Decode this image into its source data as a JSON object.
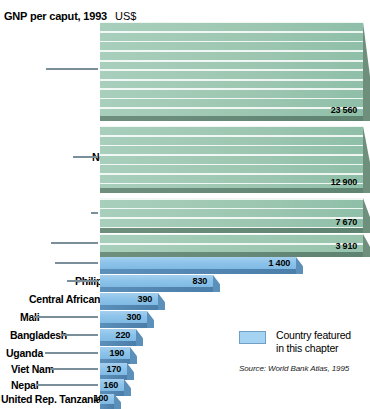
{
  "header": {
    "title": "GNP per caput, 1993",
    "unit": "US$"
  },
  "legend": {
    "label_line1": "Country featured",
    "label_line2": "in this chapter",
    "swatch_color": "#a5d4f2",
    "swatch_name": "legend-swatch-featured"
  },
  "source": "Source: World Bank Atlas, 1995",
  "colors": {
    "green": "#9ec7b2",
    "green_dark": "#6f8f7d",
    "blue": "#8ec4ea",
    "blue_dark": "#5b90bb",
    "leader": "#7a8f9a"
  },
  "chart_data": {
    "type": "bar",
    "orientation": "horizontal",
    "title": "GNP per caput, 1993",
    "xlabel": "US$",
    "ylabel": "",
    "grid": false,
    "legend_position": "bottom-right",
    "legend_entries": [
      "Country featured in this chapter"
    ],
    "annotation": "Source: World Bank Atlas, 1995",
    "note": "Bar lengths are not linearly proportional; top bars are truncated to the plot width.",
    "categories": [
      "Germany",
      "New Zealand",
      "Republic of Korea",
      "Uruguay",
      "Colombia",
      "Philippines",
      "Central African Rep.",
      "Mali",
      "Bangladesh",
      "Uganda",
      "Viet Nam",
      "Nepal",
      "United Rep. Tanzania"
    ],
    "values": [
      23560,
      12900,
      7670,
      3910,
      1400,
      830,
      390,
      300,
      220,
      190,
      170,
      160,
      100
    ],
    "value_labels": [
      "23 560",
      "12 900",
      "7 670",
      "3 910",
      "1 400",
      "830",
      "390",
      "300",
      "220",
      "190",
      "170",
      "160",
      "100"
    ],
    "featured": [
      false,
      false,
      false,
      false,
      true,
      true,
      true,
      true,
      true,
      true,
      true,
      true,
      true
    ],
    "series": [
      {
        "name": "GNP per caput 1993 (US$)",
        "values": [
          23560,
          12900,
          7670,
          3910,
          1400,
          830,
          390,
          300,
          220,
          190,
          170,
          160,
          100
        ]
      }
    ]
  },
  "rows": [
    {
      "label": "Germany",
      "value_label": "23 560",
      "top": 22,
      "height": 94,
      "bar_width": 263,
      "label_x": 193,
      "lead_left": 46,
      "lead_width": 52,
      "color": "green"
    },
    {
      "label": "New Zealand",
      "value_label": "12 900",
      "top": 126,
      "height": 62,
      "bar_width": 263,
      "label_x": 92,
      "lead_left": 73,
      "lead_width": 25,
      "color": "green"
    },
    {
      "label": "Republic of Korea",
      "value_label": "7 670",
      "top": 198,
      "height": 30,
      "bar_width": 263,
      "label_x": 199,
      "lead_left": 91,
      "lead_width": 7,
      "color": "green"
    },
    {
      "label": "Uruguay",
      "value_label": "3 910",
      "top": 234,
      "height": 18,
      "bar_width": 263,
      "label_x": 241,
      "lead_left": 51,
      "lead_width": 47,
      "color": "green"
    },
    {
      "label": "Colombia",
      "value_label": "1 400",
      "top": 257,
      "height": 12,
      "bar_width": 196,
      "label_x": 155,
      "lead_left": 55,
      "lead_width": 43,
      "color": "blue"
    },
    {
      "label": "Philippines",
      "value_label": "830",
      "top": 275,
      "height": 12,
      "bar_width": 113,
      "label_x": 75,
      "lead_left": 67,
      "lead_width": 31,
      "color": "blue"
    },
    {
      "label": "Central African Rep.",
      "value_label": "390",
      "top": 293,
      "height": 12,
      "bar_width": 58,
      "label_x": 29,
      "lead_left": 99,
      "lead_width": 0,
      "color": "blue"
    },
    {
      "label": "Mali",
      "value_label": "300",
      "top": 311,
      "height": 12,
      "bar_width": 47,
      "label_x": 20,
      "lead_left": 33,
      "lead_width": 65,
      "color": "blue"
    },
    {
      "label": "Bangladesh",
      "value_label": "220",
      "top": 329,
      "height": 12,
      "bar_width": 36,
      "label_x": 10,
      "lead_left": 62,
      "lead_width": 36,
      "color": "blue"
    },
    {
      "label": "Uganda",
      "value_label": "190",
      "top": 347,
      "height": 12,
      "bar_width": 30,
      "label_x": 6,
      "lead_left": 45,
      "lead_width": 53,
      "color": "blue"
    },
    {
      "label": "Viet Nam",
      "value_label": "170",
      "top": 363,
      "height": 12,
      "bar_width": 27,
      "label_x": 11,
      "lead_left": 50,
      "lead_width": 48,
      "color": "blue"
    },
    {
      "label": "Nepal",
      "value_label": "160",
      "top": 379,
      "height": 12,
      "bar_width": 24,
      "label_x": 11,
      "lead_left": 36,
      "lead_width": 62,
      "color": "blue"
    },
    {
      "label": "United Rep. Tanzania",
      "value_label": "100",
      "top": 394,
      "height": 10,
      "bar_width": 14,
      "label_x": 1,
      "lead_left": 99,
      "lead_width": 0,
      "color": "blue"
    }
  ]
}
